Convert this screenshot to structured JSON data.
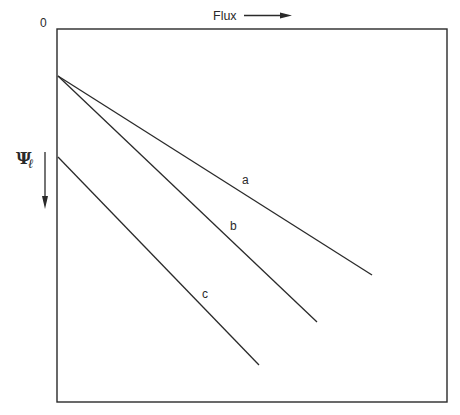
{
  "diagram": {
    "origin_label": "0",
    "x_axis": {
      "label": "Flux",
      "direction": "right"
    },
    "y_axis": {
      "label_main": "Ψ",
      "label_sub": "ℓ",
      "direction": "down"
    },
    "lines": [
      {
        "id": "a",
        "label": "a",
        "x1": 58,
        "y1": 76,
        "x2": 372,
        "y2": 275
      },
      {
        "id": "b",
        "label": "b",
        "x1": 58,
        "y1": 76,
        "x2": 317,
        "y2": 322
      },
      {
        "id": "c",
        "label": "c",
        "x1": 58,
        "y1": 157,
        "x2": 259,
        "y2": 365
      }
    ],
    "colors": {
      "line": "#2a2a2a",
      "background": "#ffffff"
    }
  }
}
